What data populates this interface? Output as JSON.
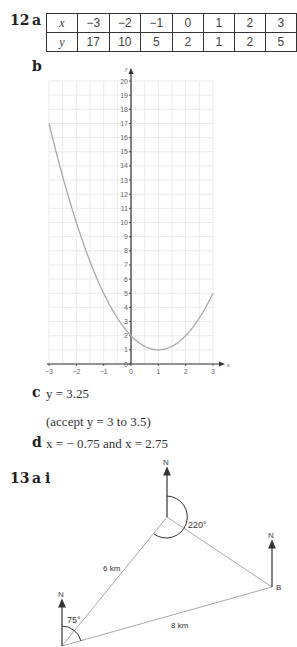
{
  "q12": {
    "number": "12",
    "part_a": "a",
    "part_b": "b",
    "part_c": "c",
    "part_d": "d",
    "table": {
      "row_labels": [
        "x",
        "y"
      ],
      "x": [
        "−3",
        "−2",
        "−1",
        "0",
        "1",
        "2",
        "3"
      ],
      "y": [
        "17",
        "10",
        "5",
        "2",
        "1",
        "2",
        "5"
      ]
    },
    "answer_c": "y = 3.25",
    "answer_c_note": "(accept y = 3 to 3.5)",
    "answer_d": "x = − 0.75 and x = 2.75"
  },
  "chart_data": {
    "type": "line",
    "title": "",
    "xlabel": "x",
    "ylabel": "y",
    "x": [
      -3,
      -2,
      -1,
      0,
      1,
      2,
      3
    ],
    "series": [
      {
        "name": "y = x^2 - 2x + 2",
        "values": [
          17,
          10,
          5,
          2,
          1,
          2,
          5
        ]
      }
    ],
    "xlim": [
      -3,
      3
    ],
    "ylim": [
      0,
      20
    ],
    "x_ticks": [
      "-3",
      "-2",
      "-1",
      "0",
      "1",
      "2",
      "3"
    ],
    "y_ticks": [
      "0",
      "1",
      "2",
      "3",
      "4",
      "5",
      "6",
      "7",
      "8",
      "9",
      "10",
      "11",
      "12",
      "13",
      "14",
      "15",
      "16",
      "17",
      "18",
      "19",
      "20"
    ],
    "grid": true
  },
  "q13": {
    "number": "13",
    "part_a": "a",
    "part_i": "i",
    "diagram": {
      "north_label": "N",
      "angle_a": "75°",
      "angle_top": "220°",
      "side_1": "6 km",
      "side_2": "8 km",
      "point_b": "B"
    }
  }
}
